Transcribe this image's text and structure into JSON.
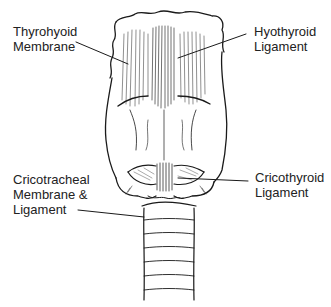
{
  "diagram": {
    "labels": [
      {
        "id": "thyrohyoid-membrane",
        "text": "Thyrohyoid\nMembrane"
      },
      {
        "id": "hyothyroid-ligament",
        "text": "Hyothyroid\nLigament"
      },
      {
        "id": "cricotracheal",
        "text": "Cricotracheal\nMembrane &\nLigament"
      },
      {
        "id": "cricothyroid-ligament",
        "text": "Cricothyroid\nLigament"
      }
    ]
  }
}
